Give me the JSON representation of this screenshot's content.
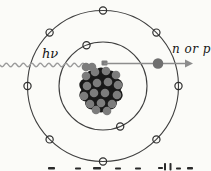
{
  "diagram": {
    "type": "atom-photodisintegration-diagram",
    "labels": {
      "photon": "hν",
      "ejected_nucleon": "n or p"
    },
    "colors": {
      "background": "#fbfbf8",
      "orbit_line": "#3f3f3f",
      "electron_stroke": "#2e2e2e",
      "photon_wave": "#9b9b9b",
      "arrow": "#8d8d8d",
      "ejected_dot": "#6f6f6f",
      "nucleon_dark": "#191919",
      "nucleon_gray": "#7c7c7c",
      "label_text": "#151515",
      "caption_fragment": "#2a2a2a"
    },
    "atom": {
      "center_x": 103,
      "center_y": 86,
      "outer_orbit_radius": 75.5,
      "inner_orbit_radius": 44,
      "electron_radius": 3.6,
      "outer_electron_angles_deg": [
        0,
        45,
        90,
        135,
        180,
        225,
        270,
        315
      ],
      "inner_electron_angles_deg": [
        112,
        293
      ]
    },
    "nucleus": {
      "center_x": 101,
      "center_y": 90,
      "dark_radius": 6.5,
      "gray_radius": 4.3,
      "dark_nucleons": [
        [
          101,
          90
        ],
        [
          110,
          90
        ],
        [
          105.5,
          82.2
        ],
        [
          96.5,
          82.2
        ],
        [
          92,
          90
        ],
        [
          96.5,
          97.8
        ],
        [
          105.5,
          97.8
        ],
        [
          116.2,
          85.1
        ],
        [
          110.4,
          77.1
        ],
        [
          101,
          74
        ],
        [
          91.6,
          77.1
        ],
        [
          85.8,
          85.1
        ],
        [
          85.8,
          94.9
        ],
        [
          91.6,
          102.9
        ],
        [
          101,
          106
        ],
        [
          110.4,
          102.9
        ],
        [
          116.2,
          94.9
        ]
      ],
      "gray_nucleons": [
        [
          86,
          76
        ],
        [
          95,
          72
        ],
        [
          106,
          71
        ],
        [
          116,
          75
        ],
        [
          87,
          86
        ],
        [
          97,
          83
        ],
        [
          108,
          82
        ],
        [
          118,
          85
        ],
        [
          84,
          96
        ],
        [
          94,
          93
        ],
        [
          105,
          93
        ],
        [
          117,
          95
        ],
        [
          90,
          104
        ],
        [
          101,
          103
        ],
        [
          112,
          104
        ],
        [
          96,
          110
        ],
        [
          107,
          111
        ],
        [
          86,
          67
        ],
        [
          92,
          67
        ]
      ]
    },
    "photon_wave": {
      "x_start": 0,
      "x_end": 87,
      "y": 65,
      "amplitude": 1.8,
      "wavelength": 8.5
    },
    "arrow": {
      "x_start": 104,
      "x_end": 185,
      "tip_x": 193,
      "y": 63.5,
      "half_head": 4,
      "dot_x": 158,
      "dot_radius": 5.3,
      "start_block": [
        101.5,
        60.5,
        6,
        5
      ]
    },
    "caption_fragments": [
      [
        48,
        167,
        7,
        2.5
      ],
      [
        75,
        167.5,
        6,
        2
      ],
      [
        93,
        167,
        8,
        2.5
      ],
      [
        115,
        167.5,
        6,
        2
      ],
      [
        135,
        167.5,
        6,
        2
      ],
      [
        158,
        167,
        5,
        2
      ],
      [
        164,
        163,
        2,
        7.5
      ],
      [
        169.5,
        163,
        2,
        7.5
      ],
      [
        176,
        167.5,
        5,
        2
      ],
      [
        187,
        167,
        6,
        2.5
      ]
    ]
  }
}
